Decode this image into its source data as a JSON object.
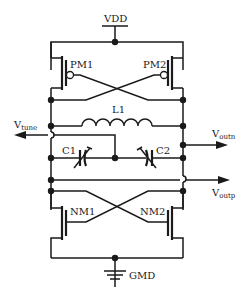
{
  "diagram": {
    "type": "LC cross-coupled VCO circuit schematic",
    "supply": {
      "label": "VDD"
    },
    "ground": {
      "label": "GMD"
    },
    "pmos": [
      {
        "id": "pm1",
        "label": "PM1"
      },
      {
        "id": "pm2",
        "label": "PM2"
      }
    ],
    "nmos": [
      {
        "id": "nm1",
        "label": "NM1"
      },
      {
        "id": "nm2",
        "label": "NM2"
      }
    ],
    "inductor": {
      "label": "L1"
    },
    "varactors": [
      {
        "id": "c1",
        "label": "C1"
      },
      {
        "id": "c2",
        "label": "C2"
      }
    ],
    "ports": {
      "vtune": {
        "main": "V",
        "sub": "tune"
      },
      "voutn": {
        "main": "V",
        "sub": "outn"
      },
      "voutp": {
        "main": "V",
        "sub": "outp"
      }
    },
    "colors": {
      "ink": "#1a1a1a",
      "background": "#ffffff"
    }
  }
}
